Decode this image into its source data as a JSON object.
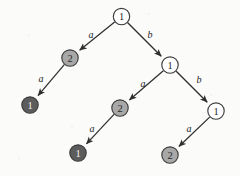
{
  "diagram": {
    "type": "tree",
    "canvas": {
      "width": 240,
      "height": 176
    },
    "colors": {
      "node_white_fill": "#ffffff",
      "node_gray_fill": "#a8a8a8",
      "node_dark_fill": "#5c5c5c",
      "node_stroke": "#3b3b3b",
      "edge_stroke": "#2e2e2e",
      "label_dark_text": "#f2f2f2",
      "label_light_text": "#2a2a2a",
      "background": "#fbfbfa"
    },
    "node_radius": 8.2,
    "nodes": [
      {
        "id": "n0",
        "label": "1",
        "shade": "white",
        "cx": 121.5,
        "cy": 16.5
      },
      {
        "id": "n1",
        "label": "2",
        "shade": "gray",
        "cx": 70.0,
        "cy": 58.0
      },
      {
        "id": "n2",
        "label": "1",
        "shade": "white",
        "cx": 170.0,
        "cy": 65.0
      },
      {
        "id": "n3",
        "label": "1",
        "shade": "dark",
        "cx": 30.0,
        "cy": 105.0
      },
      {
        "id": "n4",
        "label": "2",
        "shade": "gray",
        "cx": 120.0,
        "cy": 108.0
      },
      {
        "id": "n5",
        "label": "1",
        "shade": "white",
        "cx": 216.0,
        "cy": 111.0
      },
      {
        "id": "n6",
        "label": "1",
        "shade": "dark",
        "cx": 78.0,
        "cy": 153.0
      },
      {
        "id": "n7",
        "label": "2",
        "shade": "gray",
        "cx": 170.0,
        "cy": 155.0
      }
    ],
    "edges": [
      {
        "id": "e0",
        "from": "n0",
        "to": "n1",
        "label": "a",
        "label_x": 91,
        "label_y": 34
      },
      {
        "id": "e1",
        "from": "n0",
        "to": "n2",
        "label": "b",
        "label_x": 150,
        "label_y": 34
      },
      {
        "id": "e2",
        "from": "n1",
        "to": "n3",
        "label": "a",
        "label_x": 41,
        "label_y": 78
      },
      {
        "id": "e3",
        "from": "n2",
        "to": "n4",
        "label": "a",
        "label_x": 143,
        "label_y": 83
      },
      {
        "id": "e4",
        "from": "n2",
        "to": "n5",
        "label": "b",
        "label_x": 199,
        "label_y": 79
      },
      {
        "id": "e5",
        "from": "n4",
        "to": "n6",
        "label": "a",
        "label_x": 92,
        "label_y": 128
      },
      {
        "id": "e6",
        "from": "n5",
        "to": "n7",
        "label": "a",
        "label_x": 189,
        "label_y": 128
      }
    ]
  }
}
